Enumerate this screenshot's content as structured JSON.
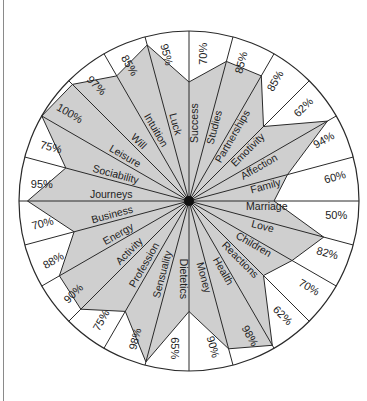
{
  "chart_data": {
    "type": "radar",
    "title": "",
    "center": [
      189,
      201
    ],
    "radius": 170,
    "fill_color": "#cfcfcf",
    "line_color": "#2a2a2a",
    "categories": [
      "Success",
      "Studies",
      "Partnerships",
      "Emotivity",
      "Affection",
      "Family",
      "Marriage",
      "Love",
      "Children",
      "Reactions",
      "Health",
      "Money",
      "Dietetics",
      "Sensuality",
      "Profession",
      "Activity",
      "Energy",
      "Business",
      "Journeys",
      "Sociability",
      "Leisure",
      "Will",
      "Intuition",
      "Luck"
    ],
    "values": [
      70,
      85,
      85,
      62,
      94,
      60,
      50,
      82,
      70,
      62,
      98,
      90,
      65,
      98,
      75,
      90,
      88,
      70,
      95,
      75,
      100,
      97,
      85,
      95
    ],
    "value_labels": [
      "70%",
      "85%",
      "85%",
      "62%",
      "94%",
      "60%",
      "50%",
      "82%",
      "70%",
      "62%",
      "98%",
      "90%",
      "65%",
      "98%",
      "75%",
      "90%",
      "88%",
      "70%",
      "95%",
      "75%",
      "100%",
      "97%",
      "85%",
      "95%"
    ],
    "range": [
      0,
      100
    ],
    "grid": false,
    "legend": "none"
  }
}
